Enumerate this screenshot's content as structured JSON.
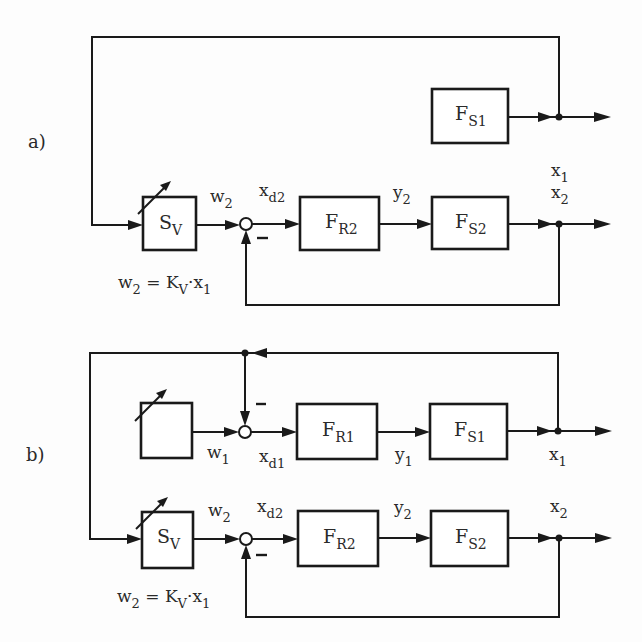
{
  "diagram": {
    "type": "block-diagram",
    "title": "",
    "parts": [
      {
        "label": "a)",
        "blocks": [
          {
            "id": "SV",
            "main": "S",
            "sub": "V",
            "adjustable": true
          },
          {
            "id": "FR2",
            "main": "F",
            "sub": "R2"
          },
          {
            "id": "FS2",
            "main": "F",
            "sub": "S2"
          },
          {
            "id": "FS1",
            "main": "F",
            "sub": "S1"
          }
        ],
        "signals": [
          {
            "main": "w",
            "sub": "2"
          },
          {
            "main": "x",
            "sub": "d2"
          },
          {
            "main": "y",
            "sub": "2"
          },
          {
            "main": "x",
            "sub": "2"
          },
          {
            "main": "x",
            "sub": "1"
          }
        ],
        "feedback_sign": "−",
        "formula": {
          "a": "w",
          "a_sub": "2",
          "eq": " = ",
          "b": "K",
          "b_sub": "V",
          "dot": "·",
          "c": "x",
          "c_sub": "1"
        }
      },
      {
        "label": "b)",
        "blocks": [
          {
            "id": "W1",
            "main": "",
            "sub": "",
            "adjustable": true
          },
          {
            "id": "FR1",
            "main": "F",
            "sub": "R1"
          },
          {
            "id": "FS1",
            "main": "F",
            "sub": "S1"
          },
          {
            "id": "SV",
            "main": "S",
            "sub": "V",
            "adjustable": true
          },
          {
            "id": "FR2",
            "main": "F",
            "sub": "R2"
          },
          {
            "id": "FS2",
            "main": "F",
            "sub": "S2"
          }
        ],
        "signals": [
          {
            "main": "w",
            "sub": "1"
          },
          {
            "main": "x",
            "sub": "d1"
          },
          {
            "main": "y",
            "sub": "1"
          },
          {
            "main": "x",
            "sub": "1"
          },
          {
            "main": "w",
            "sub": "2"
          },
          {
            "main": "x",
            "sub": "d2"
          },
          {
            "main": "y",
            "sub": "2"
          },
          {
            "main": "x",
            "sub": "2"
          }
        ],
        "feedback_signs": [
          "−",
          "−"
        ],
        "formula": {
          "a": "w",
          "a_sub": "2",
          "eq": " = ",
          "b": "K",
          "b_sub": "V",
          "dot": "·",
          "c": "x",
          "c_sub": "1"
        }
      }
    ]
  }
}
